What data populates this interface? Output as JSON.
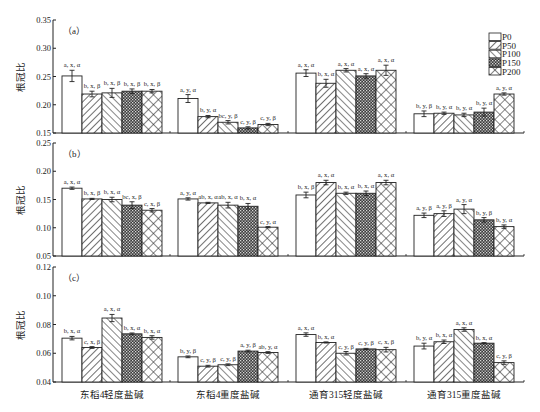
{
  "chart_data": [
    {
      "type": "bar",
      "panel": "(a)",
      "ylabel": "根冠比",
      "ylim": [
        0.15,
        0.35
      ],
      "yticks": [
        "0.15",
        "0.20",
        "0.25",
        "0.30",
        "0.35"
      ],
      "categories": [
        "东稻4轻度盐碱",
        "东稻4重度盐碱",
        "通育315轻度盐碱",
        "通育315重度盐碱"
      ],
      "series": [
        {
          "name": "P0",
          "values": [
            0.251,
            0.211,
            0.256,
            0.184
          ],
          "errors": [
            0.01,
            0.007,
            0.006,
            0.005
          ],
          "labels": [
            "a, x, α",
            "a, y, α",
            "a, x, α",
            "b, y, β"
          ]
        },
        {
          "name": "P50",
          "values": [
            0.219,
            0.179,
            0.238,
            0.185
          ],
          "errors": [
            0.005,
            0.002,
            0.007,
            0.002
          ],
          "labels": [
            "b, x, β",
            "b, y, α",
            "b, x, α",
            "b, y, α"
          ]
        },
        {
          "name": "P100",
          "values": [
            0.221,
            0.169,
            0.261,
            0.182
          ],
          "errors": [
            0.008,
            0.003,
            0.003,
            0.003
          ],
          "labels": [
            "b, x, β",
            "bc, y, β",
            "a, x, α",
            "b, y, α"
          ]
        },
        {
          "name": "P150",
          "values": [
            0.224,
            0.159,
            0.251,
            0.187
          ],
          "errors": [
            0.004,
            0.002,
            0.004,
            0.007
          ],
          "labels": [
            "b, x, β",
            "c, y, β",
            "a, x, α",
            "b, y, α"
          ]
        },
        {
          "name": "P200",
          "values": [
            0.224,
            0.165,
            0.261,
            0.219
          ],
          "errors": [
            0.003,
            0.002,
            0.009,
            0.002
          ],
          "labels": [
            "b, x, β",
            "c, y, β",
            "a, x, α",
            "a, y, α"
          ]
        }
      ]
    },
    {
      "type": "bar",
      "panel": "(b)",
      "ylabel": "根冠比",
      "ylim": [
        0.05,
        0.25
      ],
      "yticks": [
        "0.05",
        "0.10",
        "0.15",
        "0.20",
        "0.25"
      ],
      "categories": [
        "东稻4轻度盐碱",
        "东稻4重度盐碱",
        "通育315轻度盐碱",
        "通育315重度盐碱"
      ],
      "series": [
        {
          "name": "P0",
          "values": [
            0.17,
            0.151,
            0.158,
            0.122
          ],
          "errors": [
            0.002,
            0.002,
            0.005,
            0.004
          ],
          "labels": [
            "a, x, α",
            "a, y, α",
            "b, x, β",
            "a, y, β"
          ]
        },
        {
          "name": "P50",
          "values": [
            0.151,
            0.144,
            0.18,
            0.125
          ],
          "errors": [
            0.001,
            0.001,
            0.004,
            0.005
          ],
          "labels": [
            "b, x, β",
            "ab, x, α",
            "a, x, α",
            "a, y, β"
          ]
        },
        {
          "name": "P100",
          "values": [
            0.15,
            0.14,
            0.161,
            0.133
          ],
          "errors": [
            0.004,
            0.005,
            0.002,
            0.008
          ],
          "labels": [
            "b, x, α",
            "ab, x, α",
            "b, x, α",
            "a, y, α"
          ]
        },
        {
          "name": "P150",
          "values": [
            0.14,
            0.138,
            0.161,
            0.114
          ],
          "errors": [
            0.006,
            0.005,
            0.004,
            0.004
          ],
          "labels": [
            "bc, x, β",
            "b, x, α",
            "b, x, α",
            "b, y, β"
          ]
        },
        {
          "name": "P200",
          "values": [
            0.131,
            0.101,
            0.18,
            0.102
          ],
          "errors": [
            0.003,
            0.001,
            0.004,
            0.003
          ],
          "labels": [
            "c, x, β",
            "c, y, α",
            "a, x, α",
            "b, y, α"
          ]
        }
      ]
    },
    {
      "type": "bar",
      "panel": "(c)",
      "ylabel": "根冠比",
      "ylim": [
        0.04,
        0.12
      ],
      "yticks": [
        "0.04",
        "0.06",
        "0.08",
        "0.10",
        "0.12"
      ],
      "categories": [
        "东稻4轻度盐碱",
        "东稻4重度盐碱",
        "通育315轻度盐碱",
        "通育315重度盐碱"
      ],
      "series": [
        {
          "name": "P0",
          "values": [
            0.0705,
            0.0575,
            0.073,
            0.065
          ],
          "errors": [
            0.0012,
            0.0006,
            0.0012,
            0.002
          ],
          "labels": [
            "b, x, α",
            "b, y, β",
            "a, x, α",
            "b, y, α"
          ]
        },
        {
          "name": "P50",
          "values": [
            0.064,
            0.051,
            0.0675,
            0.068
          ],
          "errors": [
            0.0006,
            0.0006,
            0.0004,
            0.0012
          ],
          "labels": [
            "c, x, β",
            "c, y, β",
            "b, x, α",
            "b, x, α"
          ]
        },
        {
          "name": "P100",
          "values": [
            0.0845,
            0.052,
            0.06,
            0.0765
          ],
          "errors": [
            0.0025,
            0.0006,
            0.0012,
            0.0012
          ],
          "labels": [
            "a, x, α",
            "c, y, β",
            "c, y, β",
            "a, x, α"
          ]
        },
        {
          "name": "P150",
          "values": [
            0.0735,
            0.0615,
            0.063,
            0.067
          ],
          "errors": [
            0.0006,
            0.0006,
            0.0004,
            0.0004
          ],
          "labels": [
            "b, x, α",
            "a, y, β",
            "c, y, β",
            "b, x, α"
          ]
        },
        {
          "name": "P200",
          "values": [
            0.071,
            0.0605,
            0.0625,
            0.0535
          ],
          "errors": [
            0.0012,
            0.0006,
            0.0016,
            0.0012
          ],
          "labels": [
            "b, x, α",
            "ab, y, α",
            "c, x, β",
            "c, y, β"
          ]
        }
      ]
    }
  ],
  "legend": {
    "entries": [
      "P0",
      "P50",
      "P100",
      "P150",
      "P200"
    ],
    "patterns": [
      "blank",
      "diag-right",
      "diag-left",
      "dense-grid",
      "cross-hatch"
    ]
  },
  "colors": {
    "stroke": "#222222",
    "background": "#ffffff"
  }
}
